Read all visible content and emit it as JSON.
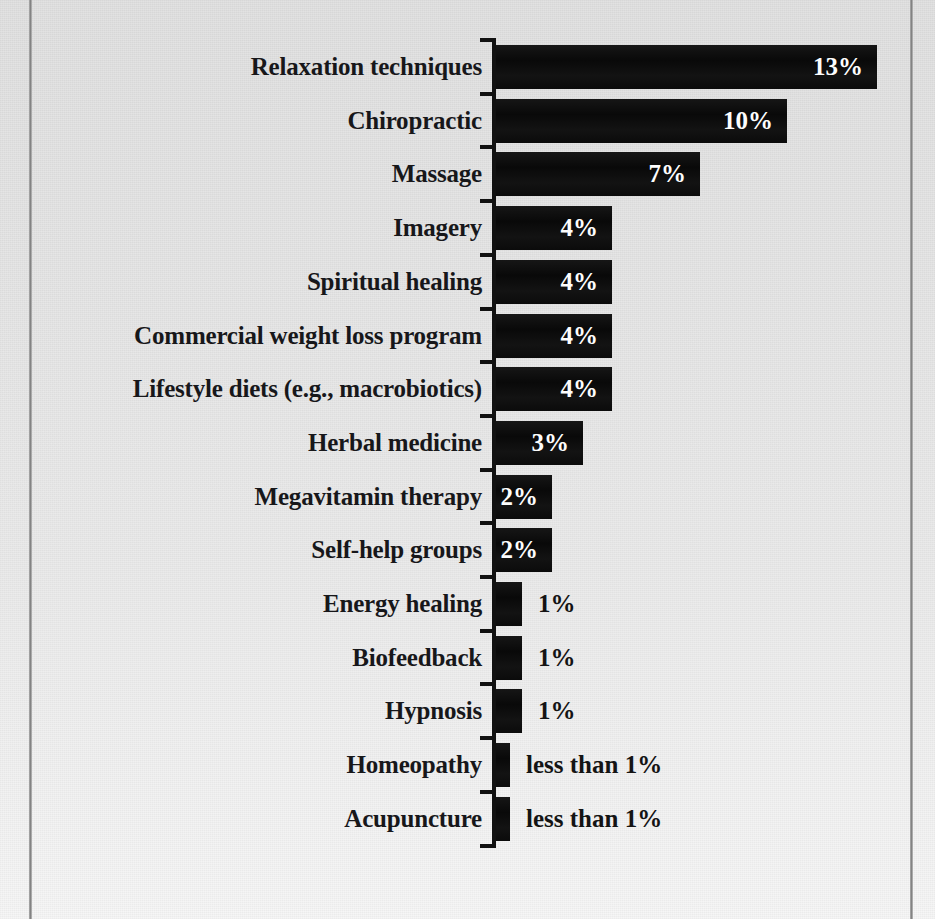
{
  "figure": {
    "kind": "scanned-bar-chart",
    "background_color": "#e6e6e6",
    "bar_color": "#101010",
    "axis_color": "#111111",
    "label_color": "#17171a",
    "inside_value_color": "#ffffff"
  },
  "chart_data": {
    "type": "bar",
    "orientation": "horizontal",
    "title": "",
    "xlabel": "",
    "ylabel": "",
    "xlim": [
      0,
      13
    ],
    "grid": false,
    "legend": null,
    "categories": [
      "Relaxation techniques",
      "Chiropractic",
      "Massage",
      "Imagery",
      "Spiritual healing",
      "Commercial weight loss program",
      "Lifestyle diets (e.g., macrobiotics)",
      "Herbal medicine",
      "Megavitamin therapy",
      "Self-help groups",
      "Energy healing",
      "Biofeedback",
      "Hypnosis",
      "Homeopathy",
      "Acupuncture"
    ],
    "values": [
      13,
      10,
      7,
      4,
      4,
      4,
      4,
      3,
      2,
      2,
      1,
      1,
      1,
      0.5,
      0.5
    ],
    "data_labels": [
      "13%",
      "10%",
      "7%",
      "4%",
      "4%",
      "4%",
      "4%",
      "3%",
      "2%",
      "2%",
      "1%",
      "1%",
      "1%",
      "less than 1%",
      "less than 1%"
    ]
  },
  "bars": [
    {
      "label": "Relaxation techniques",
      "value_text": "13%",
      "width": 381,
      "label_placement": "inside"
    },
    {
      "label": "Chiropractic",
      "value_text": "10%",
      "width": 291,
      "label_placement": "inside"
    },
    {
      "label": "Massage",
      "value_text": "7%",
      "width": 204,
      "label_placement": "inside"
    },
    {
      "label": "Imagery",
      "value_text": "4%",
      "width": 116,
      "label_placement": "inside"
    },
    {
      "label": "Spiritual healing",
      "value_text": "4%",
      "width": 116,
      "label_placement": "inside"
    },
    {
      "label": "Commercial weight loss program",
      "value_text": "4%",
      "width": 116,
      "label_placement": "inside"
    },
    {
      "label": "Lifestyle diets (e.g., macrobiotics)",
      "value_text": "4%",
      "width": 116,
      "label_placement": "inside"
    },
    {
      "label": "Herbal medicine",
      "value_text": "3%",
      "width": 87,
      "label_placement": "inside"
    },
    {
      "label": "Megavitamin therapy",
      "value_text": "2%",
      "width": 56,
      "label_placement": "inside"
    },
    {
      "label": "Self-help groups",
      "value_text": "2%",
      "width": 56,
      "label_placement": "inside"
    },
    {
      "label": "Energy healing",
      "value_text": "1%",
      "width": 26,
      "label_placement": "outside"
    },
    {
      "label": "Biofeedback",
      "value_text": "1%",
      "width": 26,
      "label_placement": "outside"
    },
    {
      "label": "Hypnosis",
      "value_text": "1%",
      "width": 26,
      "label_placement": "outside"
    },
    {
      "label": "Homeopathy",
      "value_text": "less than 1%",
      "width": 14,
      "label_placement": "outside"
    },
    {
      "label": "Acupuncture",
      "value_text": "less than 1%",
      "width": 14,
      "label_placement": "outside"
    }
  ]
}
